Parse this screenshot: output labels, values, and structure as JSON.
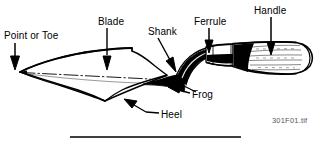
{
  "figure": {
    "background_color": "#ffffff",
    "ink_color": "#000000",
    "labels": [
      {
        "id": "point-or-toe",
        "text": "Point or Toe"
      },
      {
        "id": "blade",
        "text": "Blade"
      },
      {
        "id": "shank",
        "text": "Shank"
      },
      {
        "id": "ferrule",
        "text": "Ferrule"
      },
      {
        "id": "handle",
        "text": "Handle"
      },
      {
        "id": "frog",
        "text": "Frog"
      },
      {
        "id": "heel",
        "text": "Heel"
      }
    ],
    "watermark": "301F01.tif"
  }
}
